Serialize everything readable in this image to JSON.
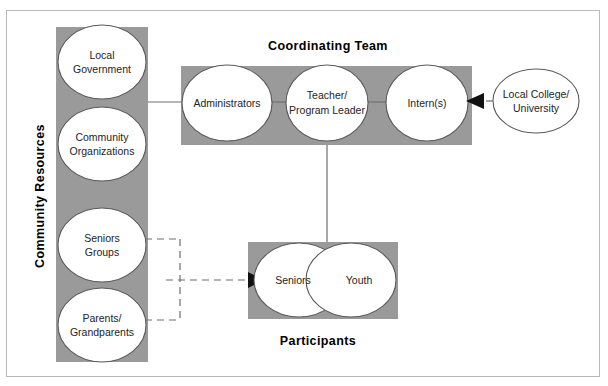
{
  "diagram": {
    "title_community": "Community Resources",
    "title_coordinating": "Coordinating Team",
    "title_participants": "Participants",
    "colors": {
      "box_gray": "#9a9a9a",
      "circle_fill": "#ffffff",
      "circle_stroke": "#5a5a5a",
      "connector": "#6f6f6f",
      "frame": "#b9b9b9",
      "text": "#242424",
      "title": "#000000"
    },
    "community_resources": {
      "label": "Community Resources",
      "nodes": [
        {
          "line1": "Local",
          "line2": "Government"
        },
        {
          "line1": "Community",
          "line2": "Organizations"
        },
        {
          "line1": "Seniors",
          "line2": "Groups"
        },
        {
          "line1": "Parents/",
          "line2": "Grandparents"
        }
      ]
    },
    "coordinating_team": {
      "label": "Coordinating Team",
      "nodes": [
        {
          "line1": "Administrators",
          "line2": ""
        },
        {
          "line1": "Teacher/",
          "line2": "Program Leader"
        },
        {
          "line1": "Intern(s)",
          "line2": ""
        }
      ]
    },
    "external": {
      "nodes": [
        {
          "line1": "Local College/",
          "line2": "University"
        }
      ]
    },
    "participants": {
      "label": "Participants",
      "nodes": [
        {
          "line1": "Seniors",
          "line2": ""
        },
        {
          "line1": "Youth",
          "line2": ""
        }
      ]
    },
    "connections": [
      {
        "name": "community-to-administrators",
        "style": "solid"
      },
      {
        "name": "administrators-to-teacher",
        "style": "solid"
      },
      {
        "name": "teacher-to-interns",
        "style": "solid"
      },
      {
        "name": "college-to-interns",
        "style": "dashed-arrow"
      },
      {
        "name": "teacher-to-participants",
        "style": "solid"
      },
      {
        "name": "seniors-groups-and-parents-to-participants",
        "style": "dashed-arrow"
      }
    ]
  }
}
